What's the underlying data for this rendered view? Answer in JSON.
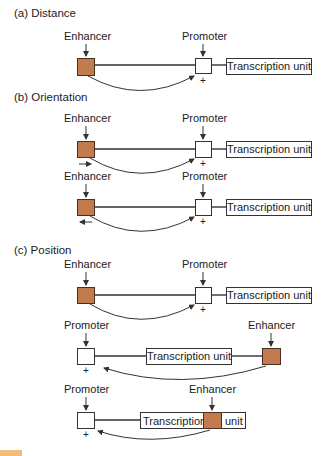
{
  "colors": {
    "enhancer": "#c27b4f",
    "line": "#333333",
    "figure_tag": "#f0a040"
  },
  "sections": [
    {
      "title": "(a) Distance"
    },
    {
      "title": "(b) Orientation"
    },
    {
      "title": "(c) Position"
    }
  ],
  "labels": {
    "enhancer": "Enhancer",
    "promoter": "Promoter",
    "transcription_unit": "Transcription unit",
    "transcription": "Transcription",
    "unit": "unit",
    "plus": "+"
  },
  "rows": [
    {
      "section": "a",
      "layout": "enhancer-promoter-tu",
      "enhancer_orientation": null
    },
    {
      "section": "b",
      "layout": "enhancer-promoter-tu",
      "enhancer_orientation": "right"
    },
    {
      "section": "b",
      "layout": "enhancer-promoter-tu",
      "enhancer_orientation": "left"
    },
    {
      "section": "c",
      "layout": "enhancer-promoter-tu",
      "enhancer_orientation": null
    },
    {
      "section": "c",
      "layout": "promoter-tu-enhancer",
      "enhancer_orientation": null
    },
    {
      "section": "c",
      "layout": "promoter-enhancer-within-tu",
      "enhancer_orientation": null
    }
  ]
}
